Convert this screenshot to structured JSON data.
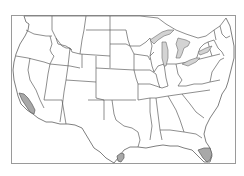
{
  "map": {
    "title": "",
    "region": "Contiguous United States",
    "frame": {
      "x": 11,
      "y": 15,
      "width": 225,
      "height": 149
    },
    "colors": {
      "background": "#ffffff",
      "frame": "#9a9a9a",
      "borders": "#5e5e5e",
      "lakes": "#d3d3d3",
      "highlight": "#a8a8a8"
    },
    "highlighted_regions": [
      {
        "name": "Southern California coast",
        "color": "#a8a8a8"
      },
      {
        "name": "South Texas tip",
        "color": "#a8a8a8"
      },
      {
        "name": "South Florida",
        "color": "#a8a8a8"
      }
    ],
    "water_features": [
      "Great Lakes"
    ]
  }
}
